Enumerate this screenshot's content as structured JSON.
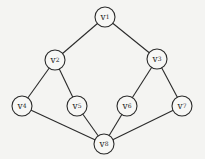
{
  "diagram": {
    "type": "graph",
    "directed": false,
    "nodes": [
      {
        "id": "v1",
        "name": "v",
        "sub": "1",
        "x": 105,
        "y": 17
      },
      {
        "id": "v2",
        "name": "v",
        "sub": "2",
        "x": 55,
        "y": 60
      },
      {
        "id": "v3",
        "name": "v",
        "sub": "3",
        "x": 157,
        "y": 59
      },
      {
        "id": "v4",
        "name": "v",
        "sub": "4",
        "x": 22,
        "y": 106
      },
      {
        "id": "v5",
        "name": "v",
        "sub": "5",
        "x": 77,
        "y": 106
      },
      {
        "id": "v6",
        "name": "v",
        "sub": "6",
        "x": 127,
        "y": 106
      },
      {
        "id": "v7",
        "name": "v",
        "sub": "7",
        "x": 182,
        "y": 106
      },
      {
        "id": "v8",
        "name": "v",
        "sub": "8",
        "x": 104,
        "y": 144
      }
    ],
    "edges": [
      [
        "v1",
        "v2"
      ],
      [
        "v1",
        "v3"
      ],
      [
        "v2",
        "v4"
      ],
      [
        "v2",
        "v5"
      ],
      [
        "v3",
        "v6"
      ],
      [
        "v3",
        "v7"
      ],
      [
        "v4",
        "v8"
      ],
      [
        "v5",
        "v8"
      ],
      [
        "v6",
        "v8"
      ],
      [
        "v7",
        "v8"
      ]
    ],
    "node_radius": 10
  }
}
